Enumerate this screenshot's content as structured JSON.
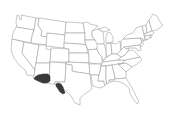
{
  "map": {
    "type": "choropleth",
    "region": "Contiguous United States",
    "base_fill": "#ffffff",
    "border_color": "#9a9a9a",
    "highlight_color": "#3a3a3a",
    "highlighted_regions": [
      {
        "name": "southern-arizona",
        "label": "Southern Arizona"
      },
      {
        "name": "southwest-new-mexico-west-texas",
        "label": "Southwestern New Mexico / West Texas"
      }
    ]
  }
}
